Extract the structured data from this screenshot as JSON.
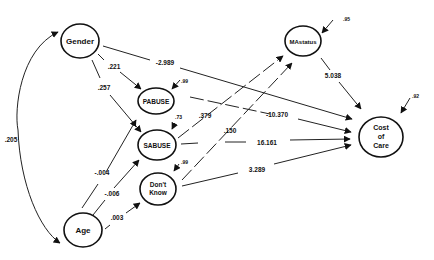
{
  "diagram": {
    "type": "path-model",
    "nodes": {
      "gender": {
        "label": "Gender"
      },
      "age": {
        "label": "Age"
      },
      "pabuse": {
        "label": "PABUSE",
        "residual": ".99"
      },
      "sabuse": {
        "label": "SABUSE",
        "residual": ".73"
      },
      "dontknow": {
        "label_line1": "Don't",
        "label_line2": "Know",
        "residual": ".99"
      },
      "mastatus": {
        "label": "MAstatus",
        "residual": ".95"
      },
      "cost": {
        "label_line1": "Cost",
        "label_line2": "of",
        "label_line3": "Care",
        "residual": ".92"
      }
    },
    "edges": [
      {
        "from": "Gender",
        "to": "Age",
        "coefficient": ".205",
        "kind": "covariance"
      },
      {
        "from": "Gender",
        "to": "PABUSE",
        "coefficient": ".221"
      },
      {
        "from": "Gender",
        "to": "SABUSE",
        "coefficient": ".257"
      },
      {
        "from": "Gender",
        "to": "Cost of Care",
        "coefficient": "-2.989"
      },
      {
        "from": "Age",
        "to": "PABUSE",
        "coefficient": "-.004"
      },
      {
        "from": "Age",
        "to": "SABUSE",
        "coefficient": "-.006"
      },
      {
        "from": "Age",
        "to": "Don't Know",
        "coefficient": ".003"
      },
      {
        "from": "SABUSE",
        "to": "MAstatus",
        "coefficient": ".379"
      },
      {
        "from": "Don't Know",
        "to": "MAstatus",
        "coefficient": ".150"
      },
      {
        "from": "PABUSE",
        "to": "Cost of Care",
        "coefficient": "-10.370"
      },
      {
        "from": "SABUSE",
        "to": "Cost of Care",
        "coefficient": "16.161"
      },
      {
        "from": "Don't Know",
        "to": "Cost of Care",
        "coefficient": "3.289"
      },
      {
        "from": "MAstatus",
        "to": "Cost of Care",
        "coefficient": "5.038"
      }
    ]
  }
}
